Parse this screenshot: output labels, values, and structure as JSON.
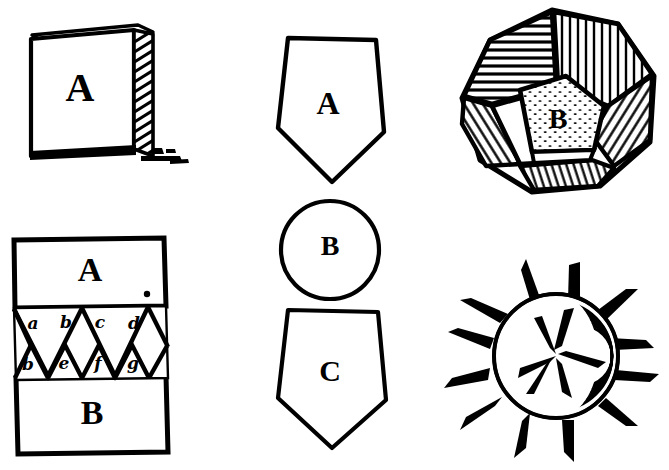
{
  "plate": {
    "title": "Geometric woodcut plate",
    "background_color": "#ffffff",
    "ink_color": "#000000",
    "figure_count": 5
  },
  "figures": [
    {
      "id": "cube-block",
      "name": "3D rectangular block",
      "position": "top-left",
      "label": "A",
      "shading": "diagonal hatching on right face",
      "has_shadow": true
    },
    {
      "id": "interlocking-wedges",
      "name": "Two blocks joined by interlocking triangular wedges",
      "position": "bottom-left",
      "top_block_label": "A",
      "bottom_block_label": "B",
      "has_dot": true,
      "upper_wedge_labels": [
        "a",
        "b",
        "c",
        "d"
      ],
      "lower_wedge_labels": [
        "b",
        "e",
        "f",
        "g"
      ]
    },
    {
      "id": "pentagon-circle-stack",
      "name": "Pentagon, circle and pentagon stacked vertically",
      "position": "center",
      "items": [
        {
          "shape": "pentagon",
          "orientation": "point-down",
          "label": "A"
        },
        {
          "shape": "circle",
          "label": "B"
        },
        {
          "shape": "pentagon",
          "orientation": "point-down",
          "label": "C"
        }
      ]
    },
    {
      "id": "dodecahedron",
      "name": "Hatched dodecahedron solid",
      "position": "top-right",
      "label": "B",
      "center_face_shading": "stippled",
      "other_faces_shading": "line hatching"
    },
    {
      "id": "spiked-sphere",
      "name": "Sphere studded with radiating spikes",
      "position": "bottom-right",
      "spike_count": 17,
      "shading": "hatched dark right limb"
    }
  ]
}
